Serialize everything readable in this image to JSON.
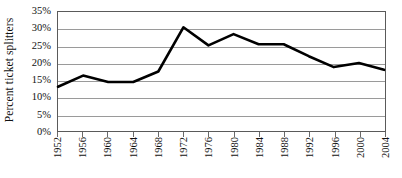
{
  "chart_data": {
    "type": "line",
    "title": "",
    "xlabel": "",
    "ylabel": "Percent ticket splitters",
    "categories": [
      "1952",
      "1956",
      "1960",
      "1964",
      "1968",
      "1972",
      "1976",
      "1980",
      "1984",
      "1988",
      "1992",
      "1996",
      "2000",
      "2004"
    ],
    "values": [
      13.0,
      16.3,
      14.4,
      14.4,
      17.5,
      30.5,
      25.2,
      28.5,
      25.5,
      25.5,
      22.0,
      18.8,
      20.0,
      18.0
    ],
    "series": [
      {
        "name": "Percent ticket splitters",
        "values": [
          13.0,
          16.3,
          14.4,
          14.4,
          17.5,
          30.5,
          25.2,
          28.5,
          25.5,
          25.5,
          22.0,
          18.8,
          20.0,
          18.0
        ]
      }
    ],
    "ylim": [
      0,
      35
    ],
    "ytick_values": [
      0,
      5,
      10,
      15,
      20,
      25,
      30,
      35
    ],
    "ytick_labels": [
      "0%",
      "5%",
      "10%",
      "15%",
      "20%",
      "25%",
      "30%",
      "35%"
    ],
    "xtick_labels": [
      "1952",
      "1956",
      "1960",
      "1964",
      "1968",
      "1972",
      "1976",
      "1980",
      "1984",
      "1988",
      "1992",
      "1996",
      "2000",
      "2004"
    ],
    "grid": true,
    "grid_axis": "y",
    "legend": false,
    "legend_position": "none",
    "line_color": "#000000",
    "line_width": 2.6,
    "markers": false,
    "plot_background": "#ffffff",
    "grid_color": "#9a9a9a",
    "frame_color": "#5a5a5a",
    "xtick_label_rotation": -90
  }
}
